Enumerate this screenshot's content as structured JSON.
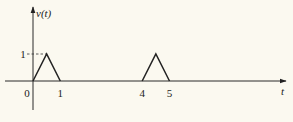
{
  "chart_data": {
    "type": "line",
    "title": "",
    "xlabel": "t",
    "ylabel": "v(t)",
    "xlim": [
      -0.75,
      7.5
    ],
    "ylim": [
      -1.1,
      2.7
    ],
    "grid": false,
    "legend": "none",
    "x_ticks": [
      {
        "value": 0,
        "label": "0"
      },
      {
        "value": 1,
        "label": "1"
      },
      {
        "value": 4,
        "label": "4"
      },
      {
        "value": 5,
        "label": "5"
      }
    ],
    "y_ticks": [
      {
        "value": 1,
        "label": "1"
      }
    ],
    "series": [
      {
        "name": "pulse-1",
        "x": [
          0,
          0.5,
          1
        ],
        "y": [
          0,
          1,
          0
        ]
      },
      {
        "name": "pulse-2",
        "x": [
          4,
          4.5,
          5
        ],
        "y": [
          0,
          1,
          0
        ]
      }
    ],
    "annotations": [
      {
        "type": "dashed-guide",
        "from": [
          0,
          1
        ],
        "to": [
          0.5,
          1
        ]
      }
    ]
  }
}
